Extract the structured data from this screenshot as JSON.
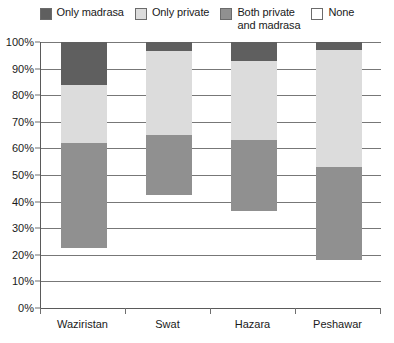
{
  "chart_data": {
    "type": "bar",
    "subtype": "stacked-100-percent",
    "title": "",
    "xlabel": "",
    "ylabel": "",
    "categories": [
      "Waziristan",
      "Swat",
      "Hazara",
      "Peshawar"
    ],
    "ylim": [
      0,
      100
    ],
    "ytick_labels": [
      "0%",
      "10%",
      "20%",
      "30%",
      "40%",
      "50%",
      "60%",
      "70%",
      "80%",
      "90%",
      "100%"
    ],
    "ytick_values": [
      0,
      10,
      20,
      30,
      40,
      50,
      60,
      70,
      80,
      90,
      100
    ],
    "grid": true,
    "legend_position": "top",
    "series": [
      {
        "name": "Only madrasa",
        "color": "#5f5f5f",
        "values": [
          16,
          3.5,
          7,
          3
        ]
      },
      {
        "name": "Only private",
        "color": "#dcdcdc",
        "values": [
          22,
          31.5,
          30,
          44
        ]
      },
      {
        "name": "Both private\nand madrasa",
        "color": "#909090",
        "values": [
          39.5,
          22.5,
          26.5,
          35
        ]
      },
      {
        "name": "None",
        "color": "#ffffff",
        "values": [
          22.5,
          42.5,
          36.5,
          18
        ]
      }
    ],
    "stack_boundaries": {
      "Waziristan": [
        100,
        84,
        62,
        22.5
      ],
      "Swat": [
        100,
        96.5,
        65,
        42.5
      ],
      "Hazara": [
        100,
        93,
        63,
        36.5
      ],
      "Peshawar": [
        100,
        97,
        53,
        18
      ]
    }
  },
  "legend": {
    "items": [
      {
        "label": "Only madrasa",
        "color": "#5f5f5f"
      },
      {
        "label": "Only private",
        "color": "#dcdcdc"
      },
      {
        "label": "Both private\nand madrasa",
        "color": "#909090"
      },
      {
        "label": "None",
        "color": "#ffffff"
      }
    ]
  }
}
